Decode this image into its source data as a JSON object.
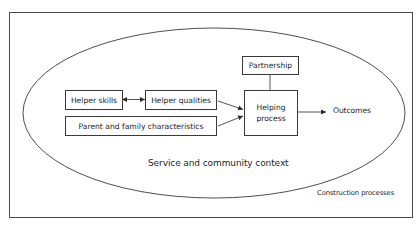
{
  "diagram": {
    "outer_frame_label": "Construction processes",
    "ellipse_label": "Service and community context",
    "nodes": {
      "partnership": "Partnership",
      "helper_skills": "Helper skills",
      "helper_qualities": "Helper qualities",
      "parent_family": "Parent and family characteristics",
      "helping_process_line1": "Helping",
      "helping_process_line2": "process",
      "outcomes": "Outcomes"
    },
    "edges": [
      {
        "from": "helper_skills",
        "to": "helper_qualities",
        "type": "bidirectional"
      },
      {
        "from": "helper_qualities",
        "to": "helping_process",
        "type": "arrow"
      },
      {
        "from": "parent_family",
        "to": "helping_process",
        "type": "arrow"
      },
      {
        "from": "partnership",
        "to": "helping_process",
        "type": "line"
      },
      {
        "from": "helping_process",
        "to": "outcomes",
        "type": "arrow"
      }
    ],
    "colors": {
      "stroke": "#3a3a3a",
      "background": "#ffffff",
      "text": "#1e1e1e"
    }
  }
}
